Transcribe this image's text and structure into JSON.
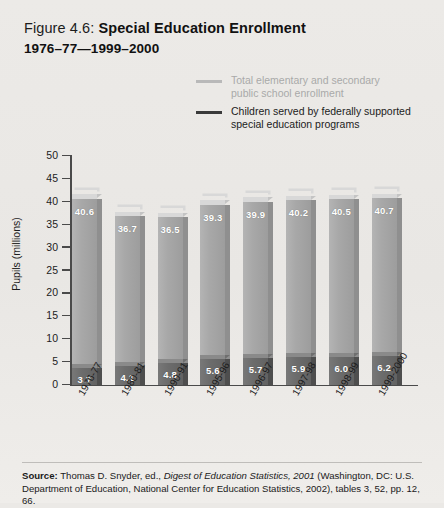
{
  "figure": {
    "number": "Figure 4.6:",
    "title": "Special Education Enrollment",
    "subtitle": "1976–77—1999–2000"
  },
  "legend": {
    "items": [
      {
        "label": "Total elementary and secondary public school enrollment",
        "line1": "Total elementary and secondary",
        "line2": "public school enrollment",
        "color": "#b9b9b9"
      },
      {
        "label": "Children served by federally supported special education programs",
        "line1": "Children served by federally supported",
        "line2": "special education programs",
        "color": "#3a3a3a"
      }
    ]
  },
  "source": {
    "label": "Source:",
    "line1_rest": " Thomas D. Snyder, ed., ",
    "italic": "Digest of Education Statistics, 2001",
    "after_italic": " (Washington, DC: U.S.",
    "line2": "Department of Education, National Center for Education Statistics, 2002), tables 3, 52, pp. 12, 66."
  },
  "chart_data": {
    "type": "bar",
    "title": "Special Education Enrollment 1976–77—1999–2000",
    "xlabel": "",
    "ylabel": "Pupils (millions)",
    "ylim": [
      0,
      50
    ],
    "yticks": [
      0,
      5,
      10,
      15,
      20,
      25,
      30,
      35,
      40,
      45,
      50
    ],
    "ytick_labels": [
      "0",
      "5",
      "10",
      "15",
      "20",
      "25",
      "30",
      "35",
      "40",
      "45",
      "50"
    ],
    "grid": false,
    "legend_position": "top-right",
    "stacked": false,
    "categories": [
      "1976-77",
      "1980-81",
      "1990-91",
      "1995-96",
      "1996-97",
      "1997-98",
      "1998-99",
      "1999-2000"
    ],
    "series": [
      {
        "name": "Total elementary and secondary public school enrollment",
        "color": "#a8a8a8",
        "values": [
          40.6,
          36.7,
          36.5,
          39.3,
          39.9,
          40.2,
          40.5,
          40.7
        ],
        "value_labels": [
          "40.6",
          "36.7",
          "36.5",
          "39.3",
          "39.9",
          "40.2",
          "40.5",
          "40.7"
        ]
      },
      {
        "name": "Children served by federally supported special education programs",
        "color": "#6c6c6c",
        "values": [
          3.7,
          4.1,
          4.8,
          5.6,
          5.7,
          5.9,
          6.0,
          6.2
        ],
        "value_labels": [
          "3.7",
          "4.1",
          "4.8",
          "5.6",
          "5.7",
          "5.9",
          "6.0",
          "6.2"
        ]
      }
    ]
  }
}
